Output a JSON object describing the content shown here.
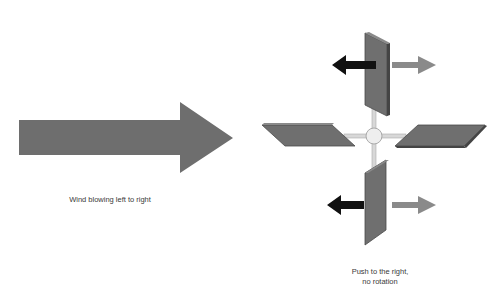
{
  "wind": {
    "caption": "Wind blowing left to right",
    "arrow_color": "#6e6e6e"
  },
  "windmill": {
    "caption_line1": "Push to the right,",
    "caption_line2": "no rotation",
    "blade_color": "#6f6f6f",
    "blade_edge_color": "#4a4a4a",
    "hub_color": "#eeeeee",
    "spoke_color": "#d8d8d8",
    "blades": [
      "top-blade",
      "left-blade",
      "right-blade",
      "bottom-blade"
    ],
    "force_arrows": {
      "opposing_color": "#111111",
      "pushing_color": "#8a8a8a"
    }
  }
}
